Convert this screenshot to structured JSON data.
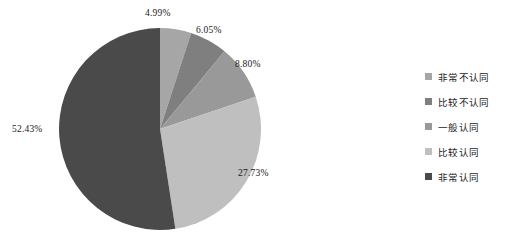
{
  "chart_data": {
    "type": "pie",
    "title": "",
    "labels": [
      "非常不认同",
      "比较不认同",
      "一般认同",
      "比较认同",
      "非常认同"
    ],
    "values": [
      4.99,
      6.05,
      8.8,
      27.73,
      52.43
    ],
    "value_labels": [
      "4.99%",
      "6.05%",
      "8.80%",
      "27.73%",
      "52.43%"
    ],
    "colors": [
      "#a6a6a6",
      "#7f7f7f",
      "#999999",
      "#bfbfbf",
      "#4a4a4a"
    ],
    "unit": "%",
    "start_angle_deg": 0,
    "direction": "clockwise",
    "legend_position": "right",
    "grid": false,
    "xlabel": "",
    "ylabel": ""
  },
  "legend": {
    "items": [
      {
        "label": "非常不认同",
        "color": "#a6a6a6"
      },
      {
        "label": "比较不认同",
        "color": "#7f7f7f"
      },
      {
        "label": "一般认同",
        "color": "#999999"
      },
      {
        "label": "比较认同",
        "color": "#bfbfbf"
      },
      {
        "label": "非常认同",
        "color": "#4a4a4a"
      }
    ]
  }
}
